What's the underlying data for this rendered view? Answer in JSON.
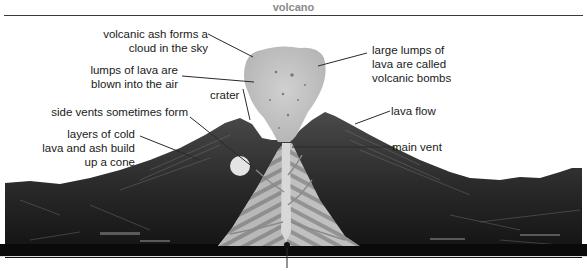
{
  "title": "volcano",
  "labels": {
    "ash_cloud": [
      "volcanic ash forms a",
      "cloud in the sky"
    ],
    "lava_lumps": [
      "lumps of lava are",
      "blown into the air"
    ],
    "bombs": [
      "large lumps of",
      "lava are called",
      "volcanic bombs"
    ],
    "crater": "crater",
    "side_vents": "side vents sometimes form",
    "cone_layers": [
      "layers of cold",
      "lava and ash build",
      "up a cone"
    ],
    "lava_flow": "lava flow",
    "main_vent": "main vent"
  },
  "colors": {
    "label_text": "#1a1a1a",
    "title_text": "#8a8a8a",
    "ash_cloud": "#c4c4c4",
    "cone_stripe_light": "#b5b5b5",
    "cone_stripe_dark": "#8c8c8c",
    "landscape_dark": "#151515",
    "landscape_mid": "#3c3c3c"
  }
}
